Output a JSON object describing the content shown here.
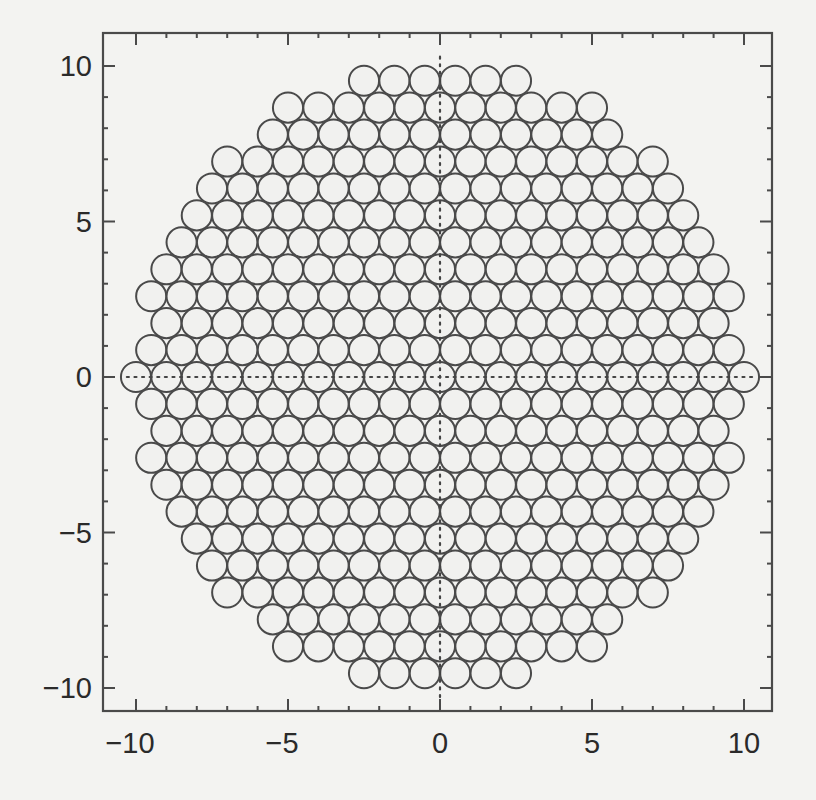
{
  "chart_data": {
    "type": "scatter",
    "subtype": "circle-packing",
    "title": "",
    "xlabel": "",
    "ylabel": "",
    "xlim": [
      -11,
      11
    ],
    "ylim": [
      -11,
      11
    ],
    "grid": false,
    "legend": null,
    "x_ticks_major": [
      -10,
      -5,
      0,
      5,
      10
    ],
    "y_ticks_major": [
      -10,
      -5,
      0,
      5,
      10
    ],
    "x_tick_labels": [
      "−10",
      "−5",
      "0",
      "5",
      "10"
    ],
    "y_tick_labels": [
      "10",
      "5",
      "0",
      "−5",
      "−10"
    ],
    "minor_tick_step": 1,
    "circle_diameter": 1.0,
    "row_spacing": 0.866,
    "packing": "hexagonal",
    "rows": [
      {
        "k": 11,
        "half_width": 2.5,
        "count": 6
      },
      {
        "k": 10,
        "half_width": 5.0,
        "count": 11
      },
      {
        "k": 9,
        "half_width": 5.5,
        "count": 12
      },
      {
        "k": 8,
        "half_width": 7.0,
        "count": 15
      },
      {
        "k": 7,
        "half_width": 7.5,
        "count": 16
      },
      {
        "k": 6,
        "half_width": 8.0,
        "count": 17
      },
      {
        "k": 5,
        "half_width": 8.5,
        "count": 18
      },
      {
        "k": 4,
        "half_width": 9.0,
        "count": 19
      },
      {
        "k": 3,
        "half_width": 9.5,
        "count": 20
      },
      {
        "k": 2,
        "half_width": 9.0,
        "count": 19
      },
      {
        "k": 1,
        "half_width": 9.5,
        "count": 20
      },
      {
        "k": 0,
        "half_width": 10.0,
        "count": 21
      },
      {
        "k": -1,
        "half_width": 9.5,
        "count": 20
      },
      {
        "k": -2,
        "half_width": 9.0,
        "count": 19
      },
      {
        "k": -3,
        "half_width": 9.5,
        "count": 20
      },
      {
        "k": -4,
        "half_width": 9.0,
        "count": 19
      },
      {
        "k": -5,
        "half_width": 8.5,
        "count": 18
      },
      {
        "k": -6,
        "half_width": 8.0,
        "count": 17
      },
      {
        "k": -7,
        "half_width": 7.5,
        "count": 16
      },
      {
        "k": -8,
        "half_width": 7.0,
        "count": 15
      },
      {
        "k": -9,
        "half_width": 5.5,
        "count": 12
      },
      {
        "k": -10,
        "half_width": 5.0,
        "count": 11
      },
      {
        "k": -11,
        "half_width": 2.5,
        "count": 6
      }
    ],
    "total_circles": 388,
    "annotations": [
      {
        "type": "dotted-line",
        "orientation": "horizontal",
        "at": 0,
        "from": -10.3,
        "to": 10.3
      },
      {
        "type": "dotted-line",
        "orientation": "vertical",
        "at": 0,
        "from": -10.3,
        "to": 10.3
      }
    ]
  },
  "colors": {
    "background": "#f3f3f1",
    "circle_fill": "#f1f1ef",
    "circle_stroke": "#4a4a4a",
    "axis": "#4a4a4a",
    "text": "#2a2a2a",
    "dots": "#444444"
  }
}
